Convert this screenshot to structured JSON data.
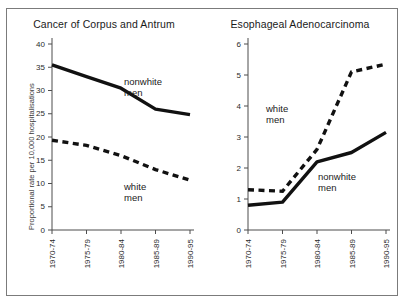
{
  "figure": {
    "width": 404,
    "height": 304,
    "background_color": "#ffffff",
    "frame_color": "#7b7b7b",
    "line_color": "#111111",
    "axis_color": "#4d4d4d"
  },
  "chart_data": [
    {
      "type": "line",
      "title": "Cancer of Corpus and Antrum",
      "xlabel": "",
      "ylabel": "Proportional rate per 10,000 hospitalisations",
      "categories": [
        "1970-74",
        "1975-79",
        "1980-84",
        "1985-89",
        "1990-95"
      ],
      "ylim": [
        0,
        40
      ],
      "yticks": [
        0,
        5,
        10,
        15,
        20,
        25,
        30,
        35,
        40
      ],
      "ytick_labels": [
        "0",
        "5",
        "10",
        "15",
        "20",
        "25",
        "30",
        "35",
        "40"
      ],
      "grid": false,
      "legend": "inline-annotations",
      "series": [
        {
          "name": "nonwhite men",
          "style": "solid",
          "label": "nonwhite\nmen",
          "label_line1": "nonwhite",
          "label_line2": "men",
          "values": [
            35.5,
            33.0,
            30.5,
            26.0,
            24.8
          ]
        },
        {
          "name": "white men",
          "style": "dashed",
          "label": "white\nmen",
          "label_line1": "white",
          "label_line2": "men",
          "values": [
            19.3,
            18.2,
            16.0,
            13.0,
            10.7
          ]
        }
      ]
    },
    {
      "type": "line",
      "title": "Esophageal Adenocarcinoma",
      "xlabel": "",
      "ylabel": "Proportional rate per 10,000 hospitalisations",
      "categories": [
        "1970-74",
        "1975-79",
        "1980-84",
        "1985-89",
        "1990-95"
      ],
      "ylim": [
        0,
        6
      ],
      "yticks": [
        0,
        1,
        2,
        3,
        4,
        5,
        6
      ],
      "ytick_labels": [
        "0",
        "1",
        "2",
        "3",
        "4",
        "5",
        "6"
      ],
      "grid": false,
      "legend": "inline-annotations",
      "series": [
        {
          "name": "white men",
          "style": "dashed",
          "label": "white\nmen",
          "label_line1": "white",
          "label_line2": "men",
          "values": [
            1.3,
            1.25,
            2.6,
            5.1,
            5.35
          ]
        },
        {
          "name": "nonwhite men",
          "style": "solid",
          "label": "nonwhite\nmen",
          "label_line1": "nonwhite",
          "label_line2": "men",
          "values": [
            0.8,
            0.9,
            2.2,
            2.5,
            3.15
          ]
        }
      ]
    }
  ]
}
